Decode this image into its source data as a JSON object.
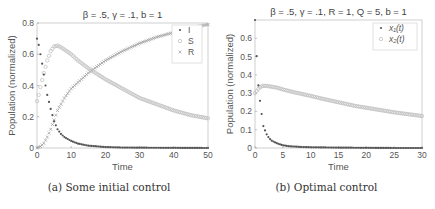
{
  "chart_data": [
    {
      "type": "scatter",
      "panel": "a",
      "title": "β = .5, γ = .1, b = 1",
      "caption": "(a) Some initial control",
      "xlabel": "Time",
      "ylabel": "Population (normalized)",
      "xlim": [
        0,
        50
      ],
      "ylim": [
        0,
        0.8
      ],
      "xticks": [
        0,
        10,
        20,
        30,
        40,
        50
      ],
      "yticks": [
        0,
        0.2,
        0.4,
        0.6,
        0.8
      ],
      "ytick_labels": [
        "0",
        "0.2",
        "0.4",
        "0.6",
        "0.8"
      ],
      "grid": false,
      "legend_position": "upper right",
      "series": [
        {
          "name": "I",
          "marker": "*",
          "color": "#555555",
          "x": [
            0,
            0.5,
            1,
            1.5,
            2,
            2.5,
            3,
            4,
            5,
            6,
            7,
            8,
            10,
            12,
            15,
            20,
            25,
            30,
            40,
            50
          ],
          "y": [
            0.7,
            0.66,
            0.6,
            0.54,
            0.47,
            0.4,
            0.34,
            0.25,
            0.17,
            0.12,
            0.09,
            0.07,
            0.045,
            0.028,
            0.015,
            0.006,
            0.003,
            0.002,
            0.001,
            0.0
          ]
        },
        {
          "name": "S",
          "marker": "o",
          "color": "#bbbbbb",
          "x": [
            0,
            0.5,
            1,
            2,
            3,
            4,
            5,
            6,
            7,
            8,
            10,
            12,
            15,
            20,
            25,
            30,
            35,
            40,
            45,
            50
          ],
          "y": [
            0.3,
            0.34,
            0.39,
            0.48,
            0.56,
            0.62,
            0.65,
            0.655,
            0.645,
            0.63,
            0.6,
            0.56,
            0.51,
            0.44,
            0.38,
            0.32,
            0.28,
            0.24,
            0.21,
            0.19
          ]
        },
        {
          "name": "R",
          "marker": "x",
          "color": "#999999",
          "x": [
            0,
            1,
            2,
            3,
            4,
            5,
            6,
            8,
            10,
            12,
            15,
            20,
            25,
            30,
            35,
            40,
            45,
            50
          ],
          "y": [
            0.0,
            0.01,
            0.03,
            0.07,
            0.12,
            0.18,
            0.24,
            0.32,
            0.38,
            0.42,
            0.48,
            0.56,
            0.62,
            0.67,
            0.71,
            0.74,
            0.77,
            0.79
          ]
        }
      ]
    },
    {
      "type": "scatter",
      "panel": "b",
      "title": "β = .5, γ = .1, R = 1, Q = 5, b = 1",
      "caption": "(b) Optimal control",
      "xlabel": "Time",
      "ylabel": "Population (normalized)",
      "xlim": [
        0,
        30
      ],
      "ylim": [
        0,
        0.7
      ],
      "xticks": [
        0,
        5,
        10,
        15,
        20,
        25,
        30
      ],
      "yticks": [
        0,
        0.1,
        0.2,
        0.3,
        0.4,
        0.5,
        0.6
      ],
      "ytick_labels": [
        "0",
        "0.1",
        "0.2",
        "0.3",
        "0.4",
        "0.5",
        "0.6"
      ],
      "grid": false,
      "legend_position": "upper right",
      "series": [
        {
          "name": "x₁(t)",
          "marker": "*",
          "color": "#555555",
          "x": [
            0,
            0.5,
            1,
            1.5,
            2,
            2.5,
            3,
            4,
            5,
            6,
            8,
            10,
            15,
            20,
            25,
            30
          ],
          "y": [
            0.7,
            0.37,
            0.23,
            0.12,
            0.08,
            0.055,
            0.04,
            0.025,
            0.015,
            0.01,
            0.006,
            0.004,
            0.002,
            0.001,
            0.0,
            0.0
          ]
        },
        {
          "name": "x₂(t)",
          "marker": "o",
          "color": "#bbbbbb",
          "x": [
            0,
            0.5,
            1,
            1.5,
            2,
            3,
            4,
            5,
            7,
            10,
            12,
            15,
            18,
            20,
            22,
            25,
            28,
            30
          ],
          "y": [
            0.3,
            0.32,
            0.335,
            0.34,
            0.34,
            0.335,
            0.33,
            0.32,
            0.305,
            0.285,
            0.27,
            0.25,
            0.23,
            0.22,
            0.21,
            0.195,
            0.183,
            0.175
          ]
        }
      ]
    }
  ],
  "panels": {
    "a": {
      "title": "β = .5, γ = .1, b = 1",
      "caption": "(a) Some initial control",
      "xlabel": "Time",
      "ylabel": "Population (normalized)",
      "legend": [
        "I",
        "S",
        "R"
      ],
      "xticks": [
        "0",
        "10",
        "20",
        "30",
        "40",
        "50"
      ],
      "yticks": [
        "0",
        "0.2",
        "0.4",
        "0.6",
        "0.8"
      ]
    },
    "b": {
      "title": "β = .5, γ = .1, R = 1, Q = 5, b = 1",
      "caption": "(b) Optimal control",
      "xlabel": "Time",
      "ylabel": "Population (normalized)",
      "legend": [
        "x₁(t)",
        "x₂(t)"
      ],
      "xticks": [
        "0",
        "5",
        "10",
        "15",
        "20",
        "25",
        "30"
      ],
      "yticks": [
        "0",
        "0.1",
        "0.2",
        "0.3",
        "0.4",
        "0.5",
        "0.6"
      ]
    }
  }
}
